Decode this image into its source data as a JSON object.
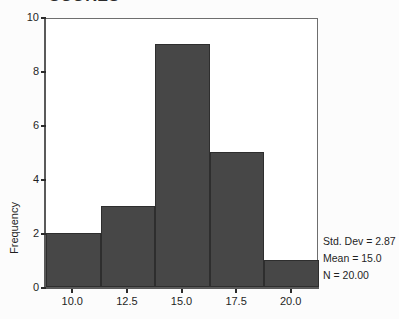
{
  "chart_data": {
    "type": "bar",
    "title": "SCORES",
    "xlabel": "",
    "ylabel": "Frequency",
    "categories": [
      "10.0",
      "12.5",
      "15.0",
      "17.5",
      "20.0"
    ],
    "bin_centers": [
      10.0,
      12.5,
      15.0,
      17.5,
      20.0
    ],
    "values": [
      2,
      3,
      9,
      5,
      1
    ],
    "bins": [
      {
        "label": "8.75-11.25",
        "center": 10.0,
        "frequency": 2
      },
      {
        "label": "11.25-13.75",
        "center": 12.5,
        "frequency": 3
      },
      {
        "label": "13.75-16.25",
        "center": 15.0,
        "frequency": 9
      },
      {
        "label": "16.25-18.75",
        "center": 17.5,
        "frequency": 5
      },
      {
        "label": "18.75-21.25",
        "center": 20.0,
        "frequency": 1
      }
    ],
    "xlim": [
      8.75,
      21.25
    ],
    "ylim": [
      0,
      10
    ],
    "y_ticks": [
      0,
      2,
      4,
      6,
      8,
      10
    ],
    "x_ticks": [
      10.0,
      12.5,
      15.0,
      17.5,
      20.0
    ],
    "grid": false,
    "legend_position": "right",
    "bar_color": "#474747",
    "bar_border_color": "#2e2e2e",
    "axis_color": "#5a5a5a",
    "annotations": [
      "Std. Dev = 2.87",
      "Mean = 15.0",
      "N = 20.00"
    ]
  },
  "title": {
    "text": "SCORES"
  },
  "axes": {
    "y_title": "Frequency",
    "y_tick_labels": [
      "10",
      "8",
      "6",
      "4",
      "2",
      "0"
    ],
    "x_tick_labels": [
      "10.0",
      "12.5",
      "15.0",
      "17.5",
      "20.0"
    ]
  },
  "stats": {
    "std_dev": "Std. Dev = 2.87",
    "mean": "Mean = 15.0",
    "n": "N = 20.00"
  }
}
